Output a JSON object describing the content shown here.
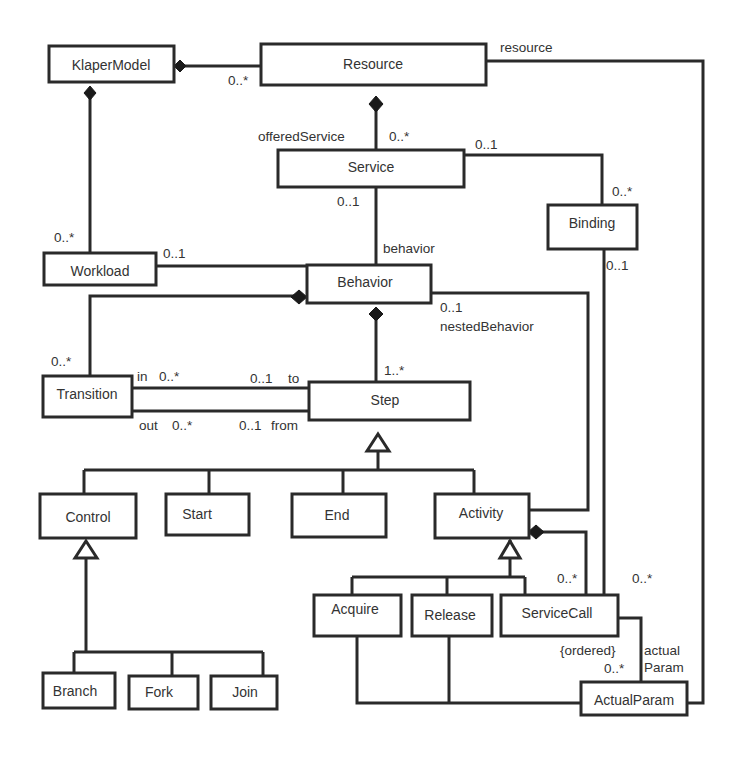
{
  "diagram": {
    "type": "uml-class-diagram",
    "classes": {
      "klaper_model": "KlaperModel",
      "resource": "Resource",
      "service": "Service",
      "binding": "Binding",
      "workload": "Workload",
      "behavior": "Behavior",
      "transition": "Transition",
      "step": "Step",
      "control": "Control",
      "start": "Start",
      "end": "End",
      "activity": "Activity",
      "branch": "Branch",
      "fork": "Fork",
      "join": "Join",
      "acquire": "Acquire",
      "release": "Release",
      "service_call": "ServiceCall",
      "actual_param": "ActualParam"
    },
    "labels": {
      "klaper_resource_mult": "0..*",
      "resource_role": "resource",
      "offered_service_role": "offeredService",
      "offered_service_mult": "0..*",
      "service_binding_mult": "0..1",
      "binding_service_mult": "0..*",
      "service_behavior_mult": "0..1",
      "behavior_role": "behavior",
      "binding_call_mult": "0..1",
      "klaper_workload_mult": "0..*",
      "workload_behavior_mult": "0..1",
      "nested_mult": "0..1",
      "nested_role": "nestedBehavior",
      "behavior_transition_mult": "0..*",
      "behavior_step_mult": "1..*",
      "in_role": "in",
      "in_mult": "0..*",
      "to_mult": "0..1",
      "to_role": "to",
      "out_role": "out",
      "out_mult": "0..*",
      "from_mult": "0..1",
      "from_role": "from",
      "activity_call_mult": "0..*",
      "resource_call_mult": "0..*",
      "ordered": "{ordered}",
      "param_mult": "0..*",
      "actual_role_1": "actual",
      "actual_role_2": "Param"
    },
    "relationships": [
      {
        "from": "KlaperModel",
        "to": "Resource",
        "kind": "composition",
        "mult": "0..*"
      },
      {
        "from": "KlaperModel",
        "to": "Workload",
        "kind": "composition",
        "mult": "0..*"
      },
      {
        "from": "Resource",
        "to": "Service",
        "kind": "composition",
        "role": "offeredService",
        "mult": "0..*"
      },
      {
        "from": "Service",
        "to": "Binding",
        "kind": "association",
        "mult": [
          "0..1",
          "0..*"
        ]
      },
      {
        "from": "Service",
        "to": "Behavior",
        "kind": "association",
        "role": "behavior",
        "mult": "0..1"
      },
      {
        "from": "Workload",
        "to": "Behavior",
        "kind": "association",
        "mult": "0..1"
      },
      {
        "from": "Behavior",
        "to": "Transition",
        "kind": "composition",
        "mult": "0..*"
      },
      {
        "from": "Behavior",
        "to": "Step",
        "kind": "composition",
        "mult": "1..*"
      },
      {
        "from": "Activity",
        "to": "Behavior",
        "kind": "association",
        "role": "nestedBehavior",
        "mult": "0..1"
      },
      {
        "from": "Transition",
        "to": "Step",
        "kind": "association",
        "roles": [
          "in 0..*",
          "0..1 to"
        ]
      },
      {
        "from": "Transition",
        "to": "Step",
        "kind": "association",
        "roles": [
          "out 0..*",
          "0..1 from"
        ]
      },
      {
        "from": "Control",
        "to": "Step",
        "kind": "generalization"
      },
      {
        "from": "Start",
        "to": "Step",
        "kind": "generalization"
      },
      {
        "from": "End",
        "to": "Step",
        "kind": "generalization"
      },
      {
        "from": "Activity",
        "to": "Step",
        "kind": "generalization"
      },
      {
        "from": "Branch",
        "to": "Control",
        "kind": "generalization"
      },
      {
        "from": "Fork",
        "to": "Control",
        "kind": "generalization"
      },
      {
        "from": "Join",
        "to": "Control",
        "kind": "generalization"
      },
      {
        "from": "Acquire",
        "to": "Activity",
        "kind": "generalization"
      },
      {
        "from": "Release",
        "to": "Activity",
        "kind": "generalization"
      },
      {
        "from": "ServiceCall",
        "to": "Activity",
        "kind": "generalization"
      },
      {
        "from": "Activity",
        "to": "ServiceCall",
        "kind": "composition",
        "mult": "0..*"
      },
      {
        "from": "Binding",
        "to": "ServiceCall",
        "kind": "association",
        "mult": "0..1"
      },
      {
        "from": "Resource",
        "to": "ServiceCall/Acquire/Release",
        "kind": "association",
        "role": "resource",
        "mult": "0..*"
      },
      {
        "from": "ServiceCall",
        "to": "ActualParam",
        "kind": "association",
        "role": "actualParam",
        "mult": "0..*",
        "constraint": "{ordered}"
      }
    ]
  }
}
